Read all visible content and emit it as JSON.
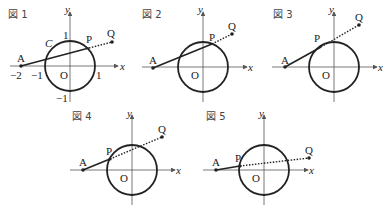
{
  "figures": [
    {
      "title": "図 1",
      "origin_label": "O",
      "x_axis": "x",
      "y_axis": "y",
      "circle_label": "C",
      "points": {
        "A": "A",
        "P": "P",
        "Q": "Q"
      },
      "ticks": {
        "x_neg2": "−2",
        "x_neg1": "−1",
        "x_pos1": "1",
        "y_pos1": "1",
        "y_neg1": "−1"
      }
    },
    {
      "title": "図 2",
      "origin_label": "O",
      "x_axis": "x",
      "y_axis": "y",
      "points": {
        "A": "A",
        "P": "P",
        "Q": "Q"
      }
    },
    {
      "title": "図 3",
      "origin_label": "O",
      "x_axis": "x",
      "y_axis": "y",
      "points": {
        "A": "A",
        "P": "P",
        "Q": "Q"
      }
    },
    {
      "title": "図 4",
      "origin_label": "O",
      "x_axis": "x",
      "y_axis": "y",
      "points": {
        "A": "A",
        "P": "P",
        "Q": "Q"
      }
    },
    {
      "title": "図 5",
      "origin_label": "O",
      "x_axis": "x",
      "y_axis": "y",
      "points": {
        "A": "A",
        "P": "P",
        "Q": "Q"
      }
    }
  ],
  "colors": {
    "stroke": "#222222",
    "axis": "#555555"
  }
}
